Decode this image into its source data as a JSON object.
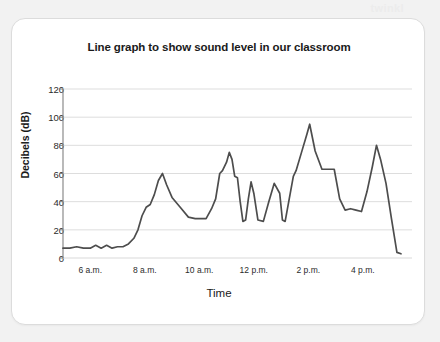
{
  "watermark": {
    "text": "twinkl"
  },
  "card": {
    "background": "#ffffff",
    "border_color": "#dcdcdc"
  },
  "chart_data": {
    "type": "line",
    "title": "Line graph to show sound level in our classroom",
    "xlabel": "Time",
    "ylabel": "Decibels (dB)",
    "ylim": [
      0,
      120
    ],
    "xlim": [
      5,
      17.4
    ],
    "grid": true,
    "legend": false,
    "line_color": "#4d4d4d",
    "grid_color": "#d9d9d9",
    "axis_color": "#808080",
    "ytick_values": [
      0,
      20,
      40,
      60,
      80,
      100,
      120
    ],
    "ytick_labels": [
      "0",
      "20",
      "40",
      "60",
      "80",
      "100",
      "120"
    ],
    "xtick_values": [
      6,
      8,
      10,
      12,
      14,
      16
    ],
    "xtick_labels": [
      "6 a.m.",
      "8 a.m.",
      "10 a.m.",
      "12 p.m.",
      "2 p.m.",
      "4 p.m."
    ],
    "series": [
      {
        "name": "Sound level",
        "x": [
          5.0,
          5.25,
          5.5,
          5.75,
          6.0,
          6.2,
          6.4,
          6.6,
          6.8,
          7.0,
          7.2,
          7.4,
          7.6,
          7.75,
          7.9,
          8.05,
          8.2,
          8.35,
          8.5,
          8.65,
          8.8,
          9.0,
          9.3,
          9.6,
          9.85,
          10.0,
          10.1,
          10.25,
          10.45,
          10.6,
          10.75,
          10.85,
          11.0,
          11.1,
          11.2,
          11.3,
          11.4,
          11.5,
          11.6,
          11.7,
          11.8,
          11.9,
          12.0,
          12.15,
          12.35,
          12.55,
          12.75,
          12.95,
          13.05,
          13.15,
          13.3,
          13.45,
          13.55,
          13.75,
          13.95,
          14.05,
          14.25,
          14.5,
          14.75,
          14.95,
          15.15,
          15.35,
          15.55,
          15.75,
          15.95,
          16.15,
          16.35,
          16.5,
          16.65,
          16.85,
          17.05,
          17.25,
          17.4
        ],
        "y": [
          7,
          7,
          8,
          7,
          7,
          9,
          7,
          9,
          7,
          8,
          8,
          10,
          14,
          20,
          30,
          36,
          38,
          45,
          55,
          60,
          52,
          43,
          36,
          29,
          28,
          28,
          28,
          28,
          35,
          42,
          60,
          62,
          68,
          75,
          70,
          58,
          57,
          40,
          26,
          27,
          42,
          54,
          46,
          27,
          26,
          40,
          53,
          46,
          27,
          26,
          42,
          58,
          62,
          75,
          88,
          95,
          76,
          63,
          63,
          63,
          42,
          34,
          35,
          34,
          33,
          47,
          65,
          80,
          70,
          53,
          28,
          4,
          3
        ]
      }
    ],
    "annotations": []
  }
}
